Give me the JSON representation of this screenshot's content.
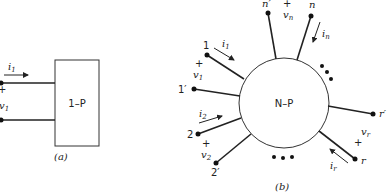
{
  "figure_a": {
    "caption": "(a)",
    "box_label": "1–P",
    "current_label": "i",
    "current_sub": "1",
    "voltage_label": "v",
    "voltage_sub": "1",
    "plus": "+"
  },
  "figure_b": {
    "caption": "(b)",
    "circle_label": "N–P",
    "ports": [
      {
        "terminal": "1",
        "terminal_prime": "1′",
        "current": "i",
        "current_sub": "1",
        "voltage": "v",
        "voltage_sub": "1",
        "plus": "+"
      },
      {
        "terminal": "2",
        "terminal_prime": "2′",
        "current": "i",
        "current_sub": "2",
        "voltage": "v",
        "voltage_sub": "2",
        "plus": "+"
      },
      {
        "terminal": "r",
        "terminal_prime": "r′",
        "current": "i",
        "current_sub": "r",
        "voltage": "v",
        "voltage_sub": "r",
        "plus": "+"
      },
      {
        "terminal": "n",
        "terminal_prime": "n′",
        "current": "i",
        "current_sub": "n",
        "voltage": "v",
        "voltage_sub": "n",
        "plus": "+"
      }
    ],
    "ellipsis": "•••"
  }
}
